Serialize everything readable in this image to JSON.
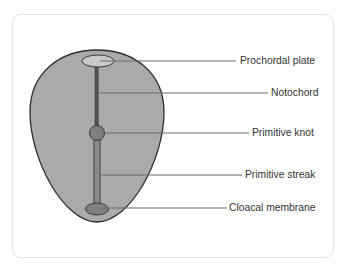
{
  "diagram": {
    "colors": {
      "frame_border": "#e3e3e3",
      "embryo_fill": "#aaaaaa",
      "embryo_stroke": "#2e2e2e",
      "prochordal_fill": "#c9c9c9",
      "structure_fill": "#7f7f7f",
      "notochord_fill": "#555555",
      "leader_line": "#6a6a6a",
      "label_text": "#333333"
    },
    "labels": [
      {
        "id": "prochordal-plate",
        "text": "Prochordal plate"
      },
      {
        "id": "notochord",
        "text": "Notochord"
      },
      {
        "id": "primitive-knot",
        "text": "Primitive knot"
      },
      {
        "id": "primitive-streak",
        "text": "Primitive streak"
      },
      {
        "id": "cloacal-membrane",
        "text": "Cloacal membrane"
      }
    ]
  }
}
